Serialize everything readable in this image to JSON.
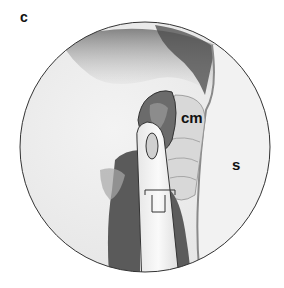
{
  "figure": {
    "panel_letter": "c",
    "labels": [
      {
        "id": "cm",
        "text": "cm"
      },
      {
        "id": "s",
        "text": "s"
      }
    ],
    "colors": {
      "background": "#ffffff",
      "outline": "#333333",
      "tissue_light": "#ededed",
      "tissue_mid": "#b5b5b5",
      "tissue_dark": "#555555",
      "instrument": "#f4f4f4"
    }
  }
}
